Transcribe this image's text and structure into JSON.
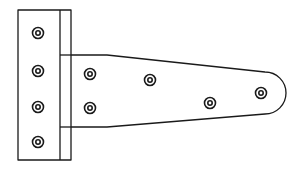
{
  "illustration": {
    "subject": "T-hinge line drawing",
    "stroke_color": "#1a1a1a",
    "background_color": "#ffffff",
    "leaf": {
      "screw_count": 4,
      "screws": [
        {
          "cx": 38,
          "cy": 33
        },
        {
          "cx": 38,
          "cy": 71
        },
        {
          "cx": 38,
          "cy": 107
        },
        {
          "cx": 38,
          "cy": 142
        }
      ]
    },
    "strap": {
      "screw_count": 4,
      "screws": [
        {
          "cx": 90,
          "cy": 74
        },
        {
          "cx": 90,
          "cy": 108
        },
        {
          "cx": 150,
          "cy": 80
        },
        {
          "cx": 210,
          "cy": 103
        },
        {
          "cx": 261,
          "cy": 93
        }
      ]
    }
  }
}
